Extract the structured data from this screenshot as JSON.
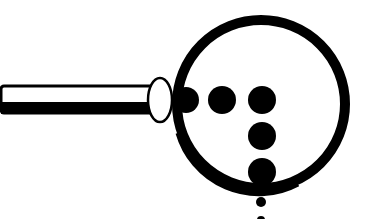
{
  "illustration": {
    "subject": "magnifying glass over braille-like dots",
    "colors": {
      "background": "#ffffff",
      "ink": "#000000"
    },
    "handle": {
      "x": 0,
      "y": 86,
      "width": 152,
      "height": 27,
      "stripe_height": 12
    },
    "ferrule": {
      "cx": 160,
      "cy": 100,
      "rx": 12,
      "ry": 22
    },
    "lens": {
      "cx": 261,
      "cy": 104,
      "r": 84,
      "stroke": 10
    },
    "dots": [
      {
        "cx": 186,
        "cy": 100,
        "r": 13
      },
      {
        "cx": 222,
        "cy": 100,
        "r": 14
      },
      {
        "cx": 262,
        "cy": 100,
        "r": 14
      },
      {
        "cx": 262,
        "cy": 136,
        "r": 14
      },
      {
        "cx": 262,
        "cy": 172,
        "r": 14
      },
      {
        "cx": 261,
        "cy": 202,
        "r": 5
      },
      {
        "cx": 261,
        "cy": 220,
        "r": 4
      }
    ]
  }
}
